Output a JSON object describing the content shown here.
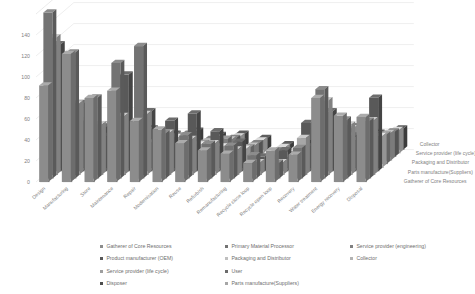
{
  "chart_data": {
    "type": "bar",
    "title": "",
    "subtitle": "",
    "xlabel": "",
    "ylabel": "",
    "zlabel": "",
    "ylim": [
      0,
      160
    ],
    "yticks": [
      0,
      20,
      40,
      60,
      80,
      100,
      120,
      140
    ],
    "grid": true,
    "legend_position": "bottom",
    "projection": "3d-clustered-column",
    "categories": [
      "Design",
      "Manufacturing",
      "Store",
      "Maintenance",
      "Repair",
      "Modernisation",
      "Reuse",
      "Refurbish",
      "Remanufacturing",
      "Recycle close loop",
      "Recycle open loop",
      "Recovery",
      "Water treatment",
      "Energy recovery",
      "Disposal"
    ],
    "depth_axis_labels": [
      "Gatherer of Core Resources",
      "Parts manufacture(Suppliers)",
      "Packaging and Distributor",
      "Service provider (life cycle)",
      "Collector"
    ],
    "series": [
      {
        "name": "Gatherer of Core Resources",
        "color": "#8c8c8c",
        "values": [
          92,
          122,
          80,
          87,
          58,
          50,
          37,
          30,
          27,
          18,
          30,
          26,
          80,
          63,
          62
        ]
      },
      {
        "name": "Primary Material Processor",
        "color": "#737373",
        "values": [
          158,
          120,
          77,
          110,
          126,
          43,
          41,
          33,
          31,
          22,
          15,
          29,
          85,
          56,
          55
        ]
      },
      {
        "name": "Parts manufacture(Suppliers)",
        "color": "#a6a6a6",
        "values": [
          131,
          68,
          48,
          56,
          58,
          40,
          34,
          30,
          24,
          12,
          12,
          35,
          71,
          48,
          52
        ]
      },
      {
        "name": "Product manufacturer (OEM)",
        "color": "#595959",
        "values": [
          121,
          65,
          42,
          92,
          57,
          48,
          55,
          38,
          28,
          14,
          20,
          46,
          57,
          34,
          70
        ]
      },
      {
        "name": "Packaging and Distributor",
        "color": "#bfbfbf",
        "values": [
          38,
          45,
          30,
          36,
          24,
          29,
          22,
          20,
          18,
          9,
          10,
          20,
          34,
          26,
          30
        ]
      },
      {
        "name": "Service provider (engineering)",
        "color": "#808080",
        "values": [
          30,
          40,
          27,
          31,
          22,
          27,
          20,
          24,
          16,
          8,
          9,
          18,
          31,
          24,
          28
        ]
      },
      {
        "name": "Service provider (life cycle)",
        "color": "#9e9e9e",
        "values": [
          28,
          34,
          24,
          28,
          20,
          24,
          18,
          20,
          14,
          7,
          8,
          16,
          28,
          22,
          26
        ]
      },
      {
        "name": "User",
        "color": "#6b6b6b",
        "values": [
          26,
          30,
          22,
          25,
          18,
          22,
          17,
          18,
          13,
          6,
          7,
          15,
          26,
          20,
          24
        ]
      },
      {
        "name": "Collector",
        "color": "#b3b3b3",
        "values": [
          24,
          27,
          20,
          22,
          16,
          20,
          15,
          16,
          12,
          6,
          6,
          14,
          24,
          18,
          22
        ]
      },
      {
        "name": "Disposer",
        "color": "#4d4d4d",
        "values": [
          22,
          24,
          18,
          20,
          15,
          18,
          14,
          15,
          11,
          5,
          6,
          13,
          22,
          16,
          20
        ]
      }
    ]
  },
  "axis": {
    "y_ticks": [
      "0",
      "20",
      "40",
      "60",
      "80",
      "100",
      "120",
      "140"
    ],
    "x_categories": [
      "Design",
      "Manufacturing",
      "Store",
      "Maintenance",
      "Repair",
      "Modernisation",
      "Reuse",
      "Refurbish",
      "Remanufacturing",
      "Recycle close loop",
      "Recycle open loop",
      "Recovery",
      "Water treatment",
      "Energy recovery",
      "Disposal"
    ],
    "z_labels": [
      "Collector",
      "Service provider (life cycle)",
      "Packaging and Distributor",
      "Parts manufacture(Suppliers)",
      "Gatherer of Core Resources"
    ]
  },
  "legend": {
    "items": [
      {
        "label": "Gatherer of Core Resources",
        "color": "#8c8c8c"
      },
      {
        "label": "Product manufacturer (OEM)",
        "color": "#595959"
      },
      {
        "label": "Service provider (life cycle)",
        "color": "#9e9e9e"
      },
      {
        "label": "Disposer",
        "color": "#4d4d4d"
      },
      {
        "label": "Primary Material Processor",
        "color": "#737373"
      },
      {
        "label": "Packaging and Distributor",
        "color": "#bfbfbf"
      },
      {
        "label": "User",
        "color": "#6b6b6b"
      },
      {
        "label": "Parts manufacture(Suppliers)",
        "color": "#a6a6a6"
      },
      {
        "label": "Service provider (engineering)",
        "color": "#808080"
      },
      {
        "label": "Collector",
        "color": "#b3b3b3"
      }
    ]
  }
}
